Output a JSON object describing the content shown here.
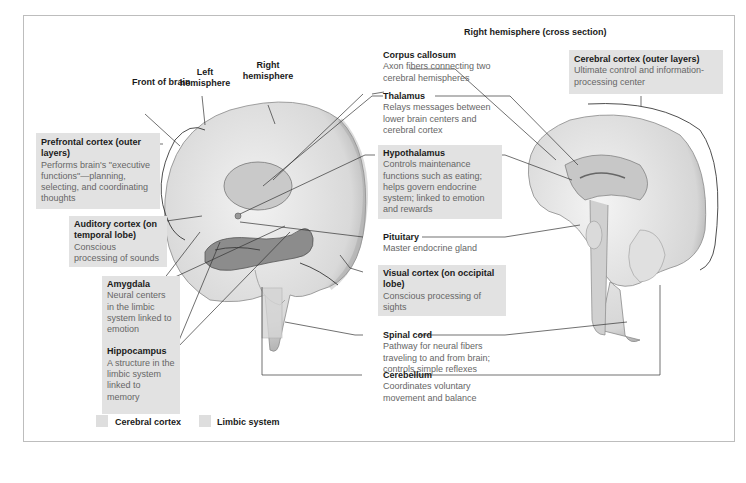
{
  "diagram": {
    "cross_section_title": "Right hemisphere (cross section)",
    "top_labels": {
      "front": "Front of brain",
      "left": "Left hemisphere",
      "right": "Right hemisphere"
    },
    "labels": {
      "prefrontal": {
        "title": "Prefrontal cortex (outer layers)",
        "desc": "Performs brain's \"executive functions\"—planning, selecting, and coordinating thoughts",
        "category": "Cerebral cortex"
      },
      "auditory": {
        "title": "Auditory cortex (on temporal lobe)",
        "desc": "Conscious processing of sounds",
        "category": "Cerebral cortex"
      },
      "amygdala": {
        "title": "Amygdala",
        "desc": "Neural centers in the limbic system linked to emotion",
        "category": "Limbic system"
      },
      "hippocampus": {
        "title": "Hippocampus",
        "desc": "A structure in the limbic system linked to memory",
        "category": "Limbic system"
      },
      "corpus": {
        "title": "Corpus callosum",
        "desc": "Axon fibers connecting two cerebral hemispheres"
      },
      "thalamus": {
        "title": "Thalamus",
        "desc": "Relays messages between lower brain centers and cerebral cortex"
      },
      "hypothalamus": {
        "title": "Hypothalamus",
        "desc": "Controls maintenance functions such as eating; helps govern endocrine system; linked to emotion and rewards",
        "category": "Limbic system"
      },
      "pituitary": {
        "title": "Pituitary",
        "desc": "Master endocrine gland"
      },
      "visual": {
        "title": "Visual cortex (on occipital lobe)",
        "desc": "Conscious processing of sights",
        "category": "Cerebral cortex"
      },
      "spinal": {
        "title": "Spinal cord",
        "desc": "Pathway for neural fibers traveling to and from brain; controls simple reflexes"
      },
      "cerebellum": {
        "title": "Cerebellum",
        "desc": "Coordinates voluntary movement and balance"
      },
      "cortex": {
        "title": "Cerebral cortex (outer layers)",
        "desc": "Ultimate control and information-processing center",
        "category": "Cerebral cortex"
      }
    },
    "legend": [
      {
        "label": "Cerebral cortex",
        "color": "#dedede"
      },
      {
        "label": "Limbic system",
        "color": "#dedede"
      }
    ]
  }
}
